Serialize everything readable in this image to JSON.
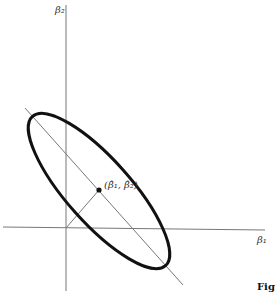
{
  "diagram": {
    "axes": {
      "x_label": "β₁",
      "y_label": "β₂"
    },
    "point_label": "(β̂₁, β̂₂)",
    "caption_fragment": "Fig",
    "elements": [
      "vertical axis β₂",
      "horizontal axis β₁",
      "ellipse contour",
      "major-axis diagonal line",
      "perpendicular from origin to center",
      "center point (β̂₁, β̂₂)"
    ]
  }
}
